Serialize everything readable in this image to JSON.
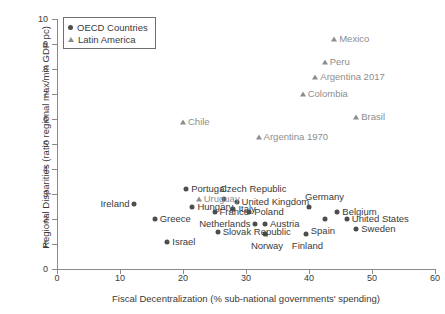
{
  "chart_data": {
    "type": "scatter",
    "title": "",
    "xlabel": "Fiscal Decentralization (% sub-national governments' spending)",
    "ylabel": "Regional Disparities (ratio regional max/min GDP pc)",
    "xlim": [
      0,
      60
    ],
    "ylim": [
      0,
      10
    ],
    "xticks": [
      0,
      10,
      20,
      30,
      40,
      50,
      60
    ],
    "yticks": [
      0,
      1,
      2,
      3,
      4,
      5,
      6,
      7,
      8,
      9,
      10
    ],
    "grid": false,
    "legend_position": "top-left",
    "series": [
      {
        "name": "OECD Countries",
        "marker": "circle",
        "color": "#4d4d4d",
        "points": [
          {
            "label": "Portugal",
            "x": 20.5,
            "y": 3.2,
            "label_pos": "right"
          },
          {
            "label": "Ireland",
            "x": 12.3,
            "y": 2.6,
            "label_pos": "left"
          },
          {
            "label": "Hungary",
            "x": 21.5,
            "y": 2.5,
            "label_pos": "right"
          },
          {
            "label": "Greece",
            "x": 15.5,
            "y": 2.0,
            "label_pos": "right"
          },
          {
            "label": "France",
            "x": 25.0,
            "y": 2.3,
            "label_pos": "right"
          },
          {
            "label": "Czech Republic",
            "x": 26.5,
            "y": 2.8,
            "label_pos": "above"
          },
          {
            "label": "United Kingdom",
            "x": 28.5,
            "y": 2.7,
            "label_pos": "right"
          },
          {
            "label": "Italy",
            "x": 28.0,
            "y": 2.4,
            "label_pos": "right"
          },
          {
            "label": "Poland",
            "x": 30.5,
            "y": 2.3,
            "label_pos": "right"
          },
          {
            "label": "Netherlands",
            "x": 31.5,
            "y": 1.8,
            "label_pos": "left"
          },
          {
            "label": "Austria",
            "x": 33.0,
            "y": 1.8,
            "label_pos": "right"
          },
          {
            "label": "Norway",
            "x": 33.0,
            "y": 1.4,
            "label_pos": "below"
          },
          {
            "label": "Slovak Republic",
            "x": 25.5,
            "y": 1.5,
            "label_pos": "right"
          },
          {
            "label": "Israel",
            "x": 17.5,
            "y": 1.1,
            "label_pos": "right"
          },
          {
            "label": "Finland",
            "x": 39.5,
            "y": 1.4,
            "label_pos": "below"
          },
          {
            "label": "Germany",
            "x": 40.0,
            "y": 2.5,
            "label_pos": "above"
          },
          {
            "label": "Spain",
            "x": 42.5,
            "y": 2.0,
            "label_pos": "below"
          },
          {
            "label": "Belgium",
            "x": 44.5,
            "y": 2.3,
            "label_pos": "right"
          },
          {
            "label": "United States",
            "x": 46.0,
            "y": 2.0,
            "label_pos": "right"
          },
          {
            "label": "Sweden",
            "x": 47.5,
            "y": 1.6,
            "label_pos": "right"
          }
        ]
      },
      {
        "name": "Latin America",
        "marker": "triangle",
        "color": "#8d8d8d",
        "points": [
          {
            "label": "Mexico",
            "x": 44.0,
            "y": 9.2,
            "label_pos": "right"
          },
          {
            "label": "Peru",
            "x": 42.5,
            "y": 8.3,
            "label_pos": "right"
          },
          {
            "label": "Argentina 2017",
            "x": 41.0,
            "y": 7.7,
            "label_pos": "right"
          },
          {
            "label": "Colombia",
            "x": 39.0,
            "y": 7.0,
            "label_pos": "right"
          },
          {
            "label": "Brasil",
            "x": 47.5,
            "y": 6.1,
            "label_pos": "right"
          },
          {
            "label": "Argentina 1970",
            "x": 32.0,
            "y": 5.3,
            "label_pos": "right"
          },
          {
            "label": "Chile",
            "x": 20.0,
            "y": 5.9,
            "label_pos": "right"
          },
          {
            "label": "Uruguay",
            "x": 22.5,
            "y": 2.8,
            "label_pos": "right"
          }
        ]
      }
    ]
  },
  "legend": {
    "items": [
      {
        "label": "OECD Countries",
        "marker": "circle"
      },
      {
        "label": "Latin America",
        "marker": "triangle"
      }
    ]
  }
}
